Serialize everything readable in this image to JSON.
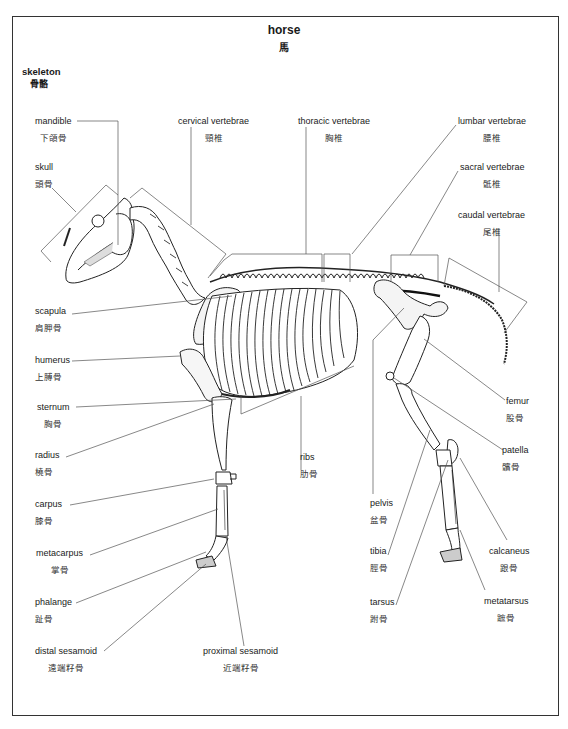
{
  "title": {
    "en": "horse",
    "zh": "馬"
  },
  "section": {
    "en": "skeleton",
    "zh": "骨骼"
  },
  "labels": {
    "mandible": {
      "en": "mandible",
      "zh": "下頜骨"
    },
    "skull": {
      "en": "skull",
      "zh": "頭骨"
    },
    "cervical": {
      "en": "cervical vertebrae",
      "zh": "頸椎"
    },
    "thoracic": {
      "en": "thoracic vertebrae",
      "zh": "胸椎"
    },
    "lumbar": {
      "en": "lumbar vertebrae",
      "zh": "腰椎"
    },
    "sacral": {
      "en": "sacral vertebrae",
      "zh": "骶椎"
    },
    "caudal": {
      "en": "caudal vertebrae",
      "zh": "尾椎"
    },
    "scapula": {
      "en": "scapula",
      "zh": "肩胛骨"
    },
    "humerus": {
      "en": "humerus",
      "zh": "上膊骨"
    },
    "sternum": {
      "en": "sternum",
      "zh": "胸骨"
    },
    "radius": {
      "en": "radius",
      "zh": "橈骨"
    },
    "carpus": {
      "en": "carpus",
      "zh": "膝骨"
    },
    "metacarpus": {
      "en": "metacarpus",
      "zh": "掌骨"
    },
    "phalange": {
      "en": "phalange",
      "zh": "趾骨"
    },
    "distal_sesamoid": {
      "en": "distal sesamoid",
      "zh": "遠端籽骨"
    },
    "proximal_sesamoid": {
      "en": "proximal sesamoid",
      "zh": "近端籽骨"
    },
    "ribs": {
      "en": "ribs",
      "zh": "肋骨"
    },
    "pelvis": {
      "en": "pelvis",
      "zh": "盆骨"
    },
    "tibia": {
      "en": "tibia",
      "zh": "脛骨"
    },
    "tarsus": {
      "en": "tarsus",
      "zh": "跗骨"
    },
    "femur": {
      "en": "femur",
      "zh": "股骨"
    },
    "patella": {
      "en": "patella",
      "zh": "髕骨"
    },
    "calcaneus": {
      "en": "calcaneus",
      "zh": "跟骨"
    },
    "metatarsus": {
      "en": "metatarsus",
      "zh": "蹠骨"
    }
  }
}
